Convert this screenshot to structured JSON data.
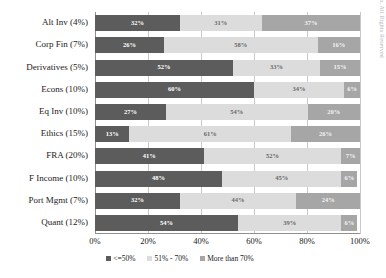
{
  "chart_data": {
    "type": "bar",
    "orientation": "horizontal",
    "stacked": true,
    "normalized": true,
    "title": "",
    "subtitle": "",
    "xlabel": "",
    "ylabel": "",
    "xlim": [
      0,
      100
    ],
    "xticks": [
      "0%",
      "20%",
      "40%",
      "60%",
      "80%",
      "100%"
    ],
    "xtick_values": [
      0,
      20,
      40,
      60,
      80,
      100
    ],
    "grid": true,
    "legend_position": "bottom",
    "categories": [
      "Alt Inv (4%)",
      "Corp Fin (7%)",
      "Derivatives (5%)",
      "Econs (10%)",
      "Eq Inv (10%)",
      "Ethics (15%)",
      "FRA (20%)",
      "F Income (10%)",
      "Port Mgmt (7%)",
      "Quant (12%)"
    ],
    "series": [
      {
        "name": "<=50%",
        "color": "#5c5c5c",
        "values": [
          32,
          26,
          52,
          60,
          27,
          13,
          41,
          48,
          32,
          54
        ],
        "labels": [
          "32%",
          "26%",
          "52%",
          "60%",
          "27%",
          "13%",
          "41%",
          "48%",
          "32%",
          "54%"
        ]
      },
      {
        "name": "51% - 70%",
        "color": "#dcdcdc",
        "values": [
          31,
          58,
          33,
          34,
          54,
          61,
          52,
          45,
          44,
          39
        ],
        "labels": [
          "31%",
          "58%",
          "33%",
          "34%",
          "54%",
          "61%",
          "52%",
          "45%",
          "44%",
          "39%"
        ]
      },
      {
        "name": "More than 70%",
        "color": "#a6a6a6",
        "values": [
          37,
          16,
          15,
          6,
          20,
          26,
          7,
          6,
          24,
          6
        ],
        "labels": [
          "37%",
          "16%",
          "15%",
          "6%",
          "20%",
          "26%",
          "7%",
          "6%",
          "24%",
          "6%"
        ]
      }
    ]
  },
  "legend": {
    "items": [
      {
        "label": "<=50%",
        "key": "k0"
      },
      {
        "label": "51% - 70%",
        "key": "k1"
      },
      {
        "label": "More than 70%",
        "key": "k2"
      }
    ]
  },
  "watermark": {
    "text": "Copyright © 2013 Finco. All Rights Reserved"
  }
}
